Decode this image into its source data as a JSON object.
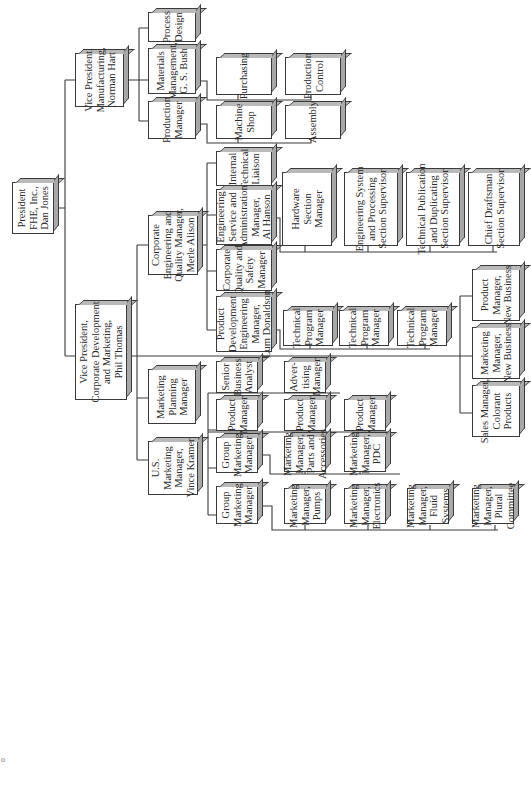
{
  "orientation": "rotated -90 degrees (hierarchy flows left to right)",
  "nodes": {
    "president": "President\nFHE, Inc.,\nDan Jones",
    "vp_manufacturing": "Vice President,\nManufacturing,\nNorman Hart",
    "process_design": "Process\nDesign",
    "materials_mgmt": "Materials\nManagement,\nG. S. Bush",
    "production_mgr": "Production\nManager",
    "purchasing": "Purchasing",
    "production_control": "Production\nControl",
    "machine_shop": "Machine\nShop",
    "assembly": "Assembly",
    "vp_corp_dev": "Vice President,\nCorporate Development\nand Marketing,\nPhil Thomas",
    "corp_eng_quality": "Corporate\nEngineering and\nQuality Manager,\nMerle Alison",
    "internal_tech_liaison": "Internal\nTechnical\nLiaison",
    "eng_service_admin": "Engineering\nService and\nAdministration\nManager,\nAl Hanson",
    "corp_quality_safety": "Corporate\nQuality and\nSafety\nManager",
    "product_dev_eng": "Product\nDevelopment\nEngineering\nManager,\nLum Donaldson",
    "hardware_section": "Hardware\nSection\nManager",
    "eng_system_processing": "Engineering System\nand Processing\nSection Supervisor",
    "tech_publication": "Technical Publication\nand Duplicating\nSection Supervisor",
    "chief_draftsman": "Chief Draftsman\nSection Supervisor",
    "tech_program_1": "Technical\nProgram\nManager",
    "tech_program_2": "Technical\nProgram\nManager",
    "tech_program_3": "Technical\nProgram\nManager",
    "product_mgr_new_business": "Product\nManager,\nNew Business",
    "marketing_mgr_new_business": "Marketing\nManager,\nNew Business",
    "sales_mgr_colorant": "Sales Manager,\nColorant\nProducts",
    "marketing_planning": "Marketing\nPlanning\nManager",
    "senior_business_analyst": "Senior\nBusiness\nAnalyst",
    "advertising_mgr": "Adver-\ntising\nManager",
    "us_marketing_mgr": "U.S.\nMarketing\nManager,\nVince Kramer",
    "group_marketing_1": "Group\nMarketing\nManager",
    "group_marketing_2": "Group\nMarketing\nManager",
    "product_mgr_1": "Product\nManager",
    "product_mgr_2": "Product\nManager",
    "product_mgr_3": "Product\nManager",
    "mm_parts_accessories": "Marketing\nManager,\nParts and\nAccessories",
    "mm_pdc": "Marketing\nManager,\nPDC",
    "mm_pumps": "Marketing\nManager,\nPumps",
    "mm_electronics": "Marketing\nManager,\nElectronics",
    "mm_fluid_systems": "Marketing\nManager,\nFluid\nSystems",
    "mm_plural_committee": "Marketing\nManager,\nPlural\nCommittee"
  },
  "stray_mark": "o",
  "colors": {
    "line": "#3a3a3a",
    "box_fill": "#ffffff",
    "box_shade": "#b0b0b0",
    "background": "#ffffff"
  }
}
